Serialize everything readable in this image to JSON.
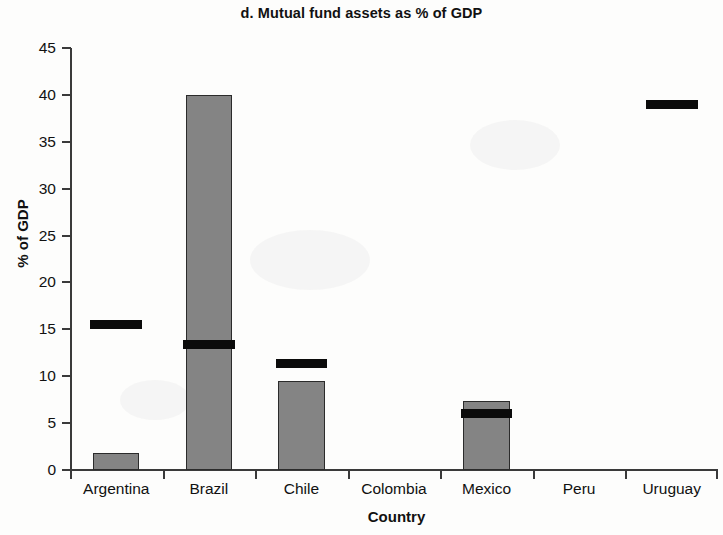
{
  "chart_data": {
    "type": "bar",
    "title": "d. Mutual fund assets as % of GDP",
    "xlabel": "Country",
    "ylabel": "% of GDP",
    "categories": [
      "Argentina",
      "Brazil",
      "Chile",
      "Colombia",
      "Mexico",
      "Peru",
      "Uruguay"
    ],
    "ylim": [
      0,
      45
    ],
    "yticks": [
      0,
      5,
      10,
      15,
      20,
      25,
      30,
      35,
      40,
      45
    ],
    "grid": false,
    "legend": "none",
    "series": [
      {
        "name": "bar",
        "render": "gray-bar",
        "color": "#848484",
        "values": [
          1.8,
          40.0,
          9.5,
          0,
          7.4,
          0,
          0
        ]
      },
      {
        "name": "marker",
        "render": "black-line",
        "color": "#0b0b0b",
        "values": [
          15.5,
          13.4,
          11.4,
          0,
          6.0,
          0,
          39.0
        ]
      }
    ]
  },
  "figure": {
    "title": "d. Mutual fund assets as % of GDP",
    "y_axis_title": "% of GDP",
    "x_axis_title": "Country"
  }
}
